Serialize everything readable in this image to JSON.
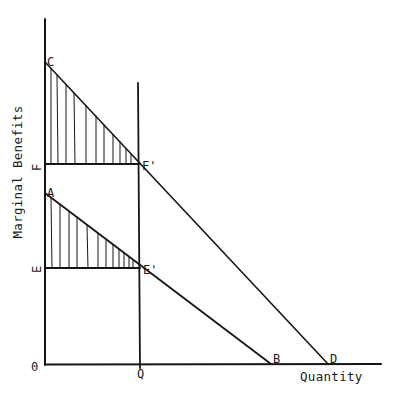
{
  "diagram": {
    "y_axis_label": "Marginal Benefits",
    "x_axis_label": "Quantity",
    "points": {
      "origin": {
        "label": "0",
        "x": 45,
        "y": 364
      },
      "C": {
        "label": "C",
        "x": 45,
        "y": 62
      },
      "A": {
        "label": "A",
        "x": 45,
        "y": 193
      },
      "F": {
        "label": "F",
        "x": 45,
        "y": 164
      },
      "E": {
        "label": "E",
        "x": 45,
        "y": 268
      },
      "F_prime": {
        "label": "F'",
        "x": 139,
        "y": 164
      },
      "E_prime": {
        "label": "E'",
        "x": 140,
        "y": 268
      },
      "Q": {
        "label": "Q",
        "x": 140,
        "y": 364
      },
      "B": {
        "label": "B",
        "x": 271,
        "y": 364
      },
      "D": {
        "label": "D",
        "x": 328,
        "y": 364
      }
    },
    "lines": {
      "upper_demand": "C to D",
      "lower_demand": "A to B",
      "quantity_line": "vertical at Q",
      "price_line_F": "F to F'",
      "price_line_E": "E to E'"
    },
    "shaded_regions": [
      "triangle C-F-F' (vertical hatching)",
      "triangle A-E-E' (vertical hatching)"
    ],
    "colors": {
      "ink": "#161616",
      "background": "#ffffff"
    }
  }
}
